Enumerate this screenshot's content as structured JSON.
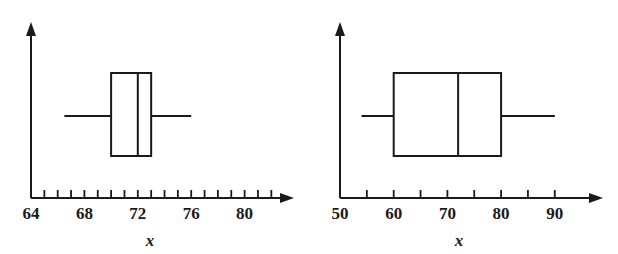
{
  "figure": {
    "background_color": "#ffffff",
    "ink_color": "#1a1a1a",
    "width": 618,
    "height": 254
  },
  "chart_data": [
    {
      "type": "box",
      "name": "left-boxplot",
      "title": "",
      "xlabel": "x",
      "ylabel": "",
      "xlim": [
        64,
        82.5
      ],
      "axis_origin": 64,
      "grid": false,
      "legend": false,
      "tick_interval": 1,
      "tick_values": [
        65,
        66,
        67,
        68,
        69,
        70,
        71,
        72,
        73,
        74,
        75,
        76,
        77,
        78,
        79,
        80,
        81,
        82
      ],
      "tick_labels": [
        "64",
        "68",
        "72",
        "76",
        "80"
      ],
      "labeled_ticks": [
        64,
        68,
        72,
        76,
        80
      ],
      "box": {
        "whisker_low": 66.5,
        "q1": 70.0,
        "median": 72.0,
        "q3": 73.0,
        "whisker_high": 76.0
      }
    },
    {
      "type": "box",
      "name": "right-boxplot",
      "title": "",
      "xlabel": "x",
      "ylabel": "",
      "xlim": [
        50,
        96
      ],
      "axis_origin": 50,
      "grid": false,
      "legend": false,
      "tick_interval": 5,
      "tick_values": [
        55,
        60,
        65,
        70,
        75,
        80,
        85,
        90
      ],
      "tick_labels": [
        "50",
        "60",
        "70",
        "80",
        "90"
      ],
      "labeled_ticks": [
        50,
        60,
        70,
        80,
        90
      ],
      "box": {
        "whisker_low": 54.0,
        "q1": 60.0,
        "median": 72.0,
        "q3": 80.0,
        "whisker_high": 90.0
      }
    }
  ],
  "left_panel": {
    "x_axis_title": "x",
    "tick_labels": [
      "64",
      "68",
      "72",
      "76",
      "80"
    ]
  },
  "right_panel": {
    "x_axis_title": "x",
    "tick_labels": [
      "50",
      "60",
      "70",
      "80",
      "90"
    ]
  }
}
